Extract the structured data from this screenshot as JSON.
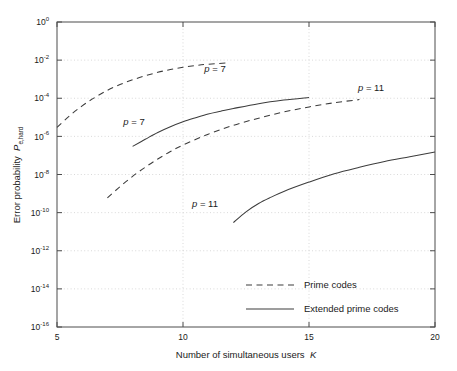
{
  "chart_data": {
    "type": "line",
    "title": "",
    "xlabel": "Number of simultaneous users   K",
    "xlabel_plain": "Number of simultaneous users",
    "xlabel_italic": "K",
    "ylabel_plain": "Error probability  P",
    "ylabel_sub": "e,hard",
    "ylabel": "Error probability P_e,hard",
    "xscale": "linear",
    "yscale": "log",
    "xlim": [
      5,
      20
    ],
    "ylim": [
      1e-16,
      1
    ],
    "grid": true,
    "legend_position": "lower-right-inside",
    "xticks": [
      5,
      10,
      15,
      20
    ],
    "xtick_labels": [
      "5",
      "10",
      "15",
      "20"
    ],
    "yticks": [
      1,
      0.01,
      0.0001,
      1e-06,
      1e-08,
      1e-10,
      1e-12,
      1e-14,
      1e-16
    ],
    "ytick_labels": [
      {
        "base": "10",
        "exp": "0"
      },
      {
        "base": "10",
        "exp": "-2"
      },
      {
        "base": "10",
        "exp": "-4"
      },
      {
        "base": "10",
        "exp": "-6"
      },
      {
        "base": "10",
        "exp": "-8"
      },
      {
        "base": "10",
        "exp": "-10"
      },
      {
        "base": "10",
        "exp": "-12"
      },
      {
        "base": "10",
        "exp": "-14"
      },
      {
        "base": "10",
        "exp": "-16"
      }
    ],
    "series": [
      {
        "name": "Prime codes, p = 7",
        "style": "dashed",
        "color": "#3c3c3c",
        "x": [
          5,
          5.5,
          6,
          6.5,
          7,
          7.5,
          8,
          8.5,
          9,
          9.5,
          10,
          10.5,
          11,
          11.8
        ],
        "y": [
          3e-06,
          1.2e-05,
          4e-05,
          0.00011,
          0.00026,
          0.00052,
          0.00093,
          0.0015,
          0.0023,
          0.0032,
          0.0042,
          0.0052,
          0.0061,
          0.0072
        ]
      },
      {
        "name": "Extended prime codes, p = 7",
        "style": "solid",
        "color": "#3c3c3c",
        "x": [
          8,
          8.5,
          9,
          9.5,
          10,
          10.5,
          11,
          11.5,
          12,
          13,
          14,
          15
        ],
        "y": [
          3e-07,
          7e-07,
          1.6e-06,
          3.2e-06,
          5.8e-06,
          9.5e-06,
          1.5e-05,
          2.1e-05,
          2.9e-05,
          5.2e-05,
          8e-05,
          0.00011
        ]
      },
      {
        "name": "Prime codes, p = 11",
        "style": "dashed",
        "color": "#3c3c3c",
        "x": [
          7,
          7.5,
          8,
          8.5,
          9,
          9.5,
          10,
          11,
          12,
          13,
          14,
          15,
          16,
          17
        ],
        "y": [
          6e-10,
          2.3e-09,
          8e-09,
          2.4e-08,
          6.5e-08,
          1.6e-07,
          3.5e-07,
          1.3e-06,
          3.8e-06,
          9e-06,
          1.9e-05,
          3.5e-05,
          5.8e-05,
          8.5e-05
        ]
      },
      {
        "name": "Extended prime codes, p = 11",
        "style": "solid",
        "color": "#3c3c3c",
        "x": [
          12,
          12.5,
          13,
          13.5,
          14,
          15,
          16,
          17,
          18,
          19,
          20
        ],
        "y": [
          3e-11,
          1.1e-10,
          3e-10,
          6.5e-10,
          1.3e-09,
          4e-09,
          1.1e-08,
          2.4e-08,
          4.8e-08,
          8.5e-08,
          1.5e-07
        ]
      }
    ],
    "annotations": [
      {
        "id": "annot-p7-prime",
        "var": "p",
        "text": " = 7",
        "full": "p = 7",
        "x_px": 215,
        "y_px": 72
      },
      {
        "id": "annot-p7-extended",
        "var": "p",
        "text": " = 7",
        "full": "p = 7",
        "x_px": 134,
        "y_px": 125
      },
      {
        "id": "annot-p11-prime",
        "var": "p",
        "text": " = 11",
        "full": "p = 11",
        "x_px": 371,
        "y_px": 91
      },
      {
        "id": "annot-p11-extended",
        "var": "p",
        "text": " = 11",
        "full": "p = 11",
        "x_px": 205,
        "y_px": 207
      }
    ],
    "legend_entries": [
      {
        "label": "Prime codes",
        "style": "dashed"
      },
      {
        "label": "Extended prime codes",
        "style": "solid"
      }
    ]
  },
  "colors": {
    "background": "#ffffff",
    "axis": "#4d4d4d",
    "grid": "#c8c8c8",
    "curve": "#3c3c3c",
    "text": "#1a1a1a"
  }
}
